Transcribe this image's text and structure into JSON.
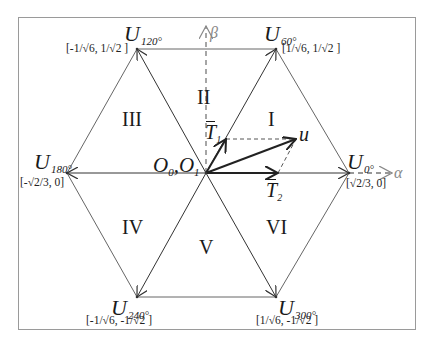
{
  "diagram": {
    "type": "space-vector-hexagon",
    "origin_label": {
      "o0": "O",
      "o0_sub": "0",
      "sep": ",",
      "o1": "O",
      "o1_sub": "1"
    },
    "axes": {
      "alpha": "α",
      "beta": "β"
    },
    "vectors": [
      {
        "id": "U0",
        "symbol": "U",
        "subscript": "0°",
        "coord": "[√2/3, 0]"
      },
      {
        "id": "U60",
        "symbol": "U",
        "subscript": "60°",
        "coord": "[1/√6, 1/√2 ]"
      },
      {
        "id": "U120",
        "symbol": "U",
        "subscript": "120°",
        "coord": "[-1/√6, 1/√2 ]"
      },
      {
        "id": "U180",
        "symbol": "U",
        "subscript": "180°",
        "coord": "[-√2/3, 0]"
      },
      {
        "id": "U240",
        "symbol": "U",
        "subscript": "240°",
        "coord": "[-1/√6, -1/√2 ]"
      },
      {
        "id": "U300",
        "symbol": "U",
        "subscript": "300°",
        "coord": "[1/√6, -1/√2 ]"
      }
    ],
    "sectors": [
      "I",
      "II",
      "III",
      "IV",
      "V",
      "VI"
    ],
    "components": {
      "t1": {
        "symbol": "T",
        "subscript": "1"
      },
      "t2": {
        "symbol": "T",
        "subscript": "2"
      },
      "u": "u"
    }
  }
}
